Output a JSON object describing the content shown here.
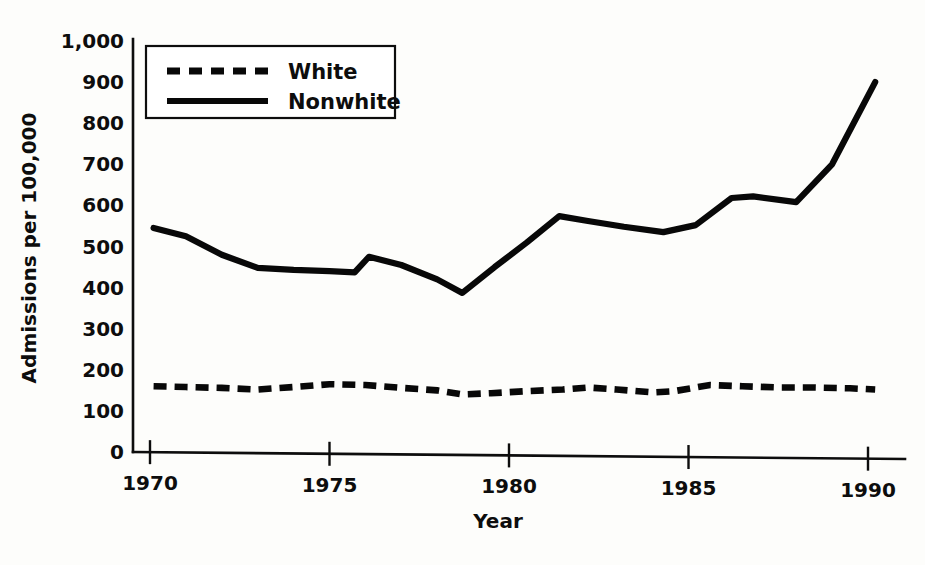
{
  "chart_data": {
    "type": "line",
    "title": "",
    "xlabel": "Year",
    "ylabel": "Admissions per 100,000",
    "xlim": [
      1969.5,
      1990.6
    ],
    "ylim": [
      0,
      1000
    ],
    "grid": false,
    "legend_position": "top-left",
    "x_ticks": [
      "1970",
      "1975",
      "1980",
      "1985",
      "1990"
    ],
    "x_tick_values": [
      1970,
      1975,
      1980,
      1985,
      1990
    ],
    "y_ticks": [
      "0",
      "100",
      "200",
      "300",
      "400",
      "500",
      "600",
      "700",
      "800",
      "900",
      "1,000"
    ],
    "y_tick_values": [
      0,
      100,
      200,
      300,
      400,
      500,
      600,
      700,
      800,
      900,
      1000
    ],
    "series": [
      {
        "name": "White",
        "style": "dashed",
        "x": [
          1970.1,
          1971,
          1972,
          1973,
          1974,
          1975,
          1976,
          1977,
          1978,
          1978.7,
          1979.5,
          1980.5,
          1981.5,
          1982.2,
          1983,
          1984,
          1984.6,
          1985.6,
          1986.5,
          1987.5,
          1988.5,
          1989.5,
          1990.2
        ],
        "values": [
          160,
          158,
          156,
          152,
          158,
          165,
          163,
          156,
          150,
          140,
          143,
          148,
          152,
          157,
          152,
          145,
          148,
          163,
          160,
          157,
          157,
          155,
          152
        ]
      },
      {
        "name": "Nonwhite",
        "style": "solid",
        "x": [
          1970.1,
          1971,
          1972,
          1973,
          1974,
          1975,
          1975.7,
          1976.1,
          1977,
          1978,
          1978.7,
          1979.6,
          1980.5,
          1981.4,
          1982.2,
          1983.2,
          1984.3,
          1985.2,
          1986.2,
          1986.8,
          1988,
          1989,
          1990.2
        ],
        "values": [
          545,
          525,
          480,
          448,
          443,
          440,
          437,
          475,
          455,
          420,
          387,
          450,
          510,
          574,
          562,
          548,
          535,
          552,
          618,
          622,
          608,
          700,
          900
        ]
      }
    ]
  }
}
